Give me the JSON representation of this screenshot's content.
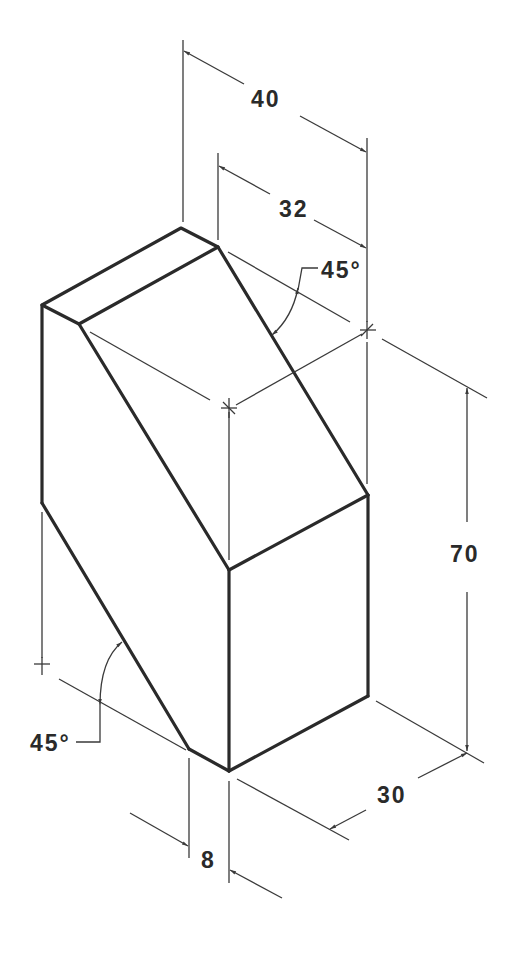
{
  "drawing": {
    "type": "isometric-technical-drawing",
    "subject": "Block with two 45° chamfered corners",
    "dimensions": {
      "width_total": "40",
      "width_top": "32",
      "height": "70",
      "depth": "30",
      "offset": "8",
      "angle_top": "45°",
      "angle_bottom": "45°"
    },
    "colors": {
      "line": "#2a2a2a",
      "background": "#ffffff"
    }
  }
}
